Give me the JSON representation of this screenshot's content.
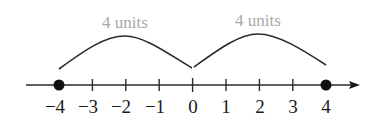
{
  "diagram": {
    "type": "number-line",
    "axis": {
      "min": -4,
      "max": 4,
      "tick_values": [
        -4,
        -3,
        -2,
        -1,
        0,
        1,
        2,
        3,
        4
      ],
      "tick_labels": [
        "−4",
        "−3",
        "−2",
        "−1",
        "0",
        "1",
        "2",
        "3",
        "4"
      ],
      "arrow_direction": "right"
    },
    "points": [
      {
        "value": -4,
        "style": "filled-dot"
      },
      {
        "value": 4,
        "style": "filled-dot"
      }
    ],
    "spans": [
      {
        "from": -4,
        "to": 0,
        "label": "4 units"
      },
      {
        "from": 0,
        "to": 4,
        "label": "4 units"
      }
    ],
    "colors": {
      "line": "#1a1a1a",
      "span_label": "#a8a8a8"
    }
  }
}
